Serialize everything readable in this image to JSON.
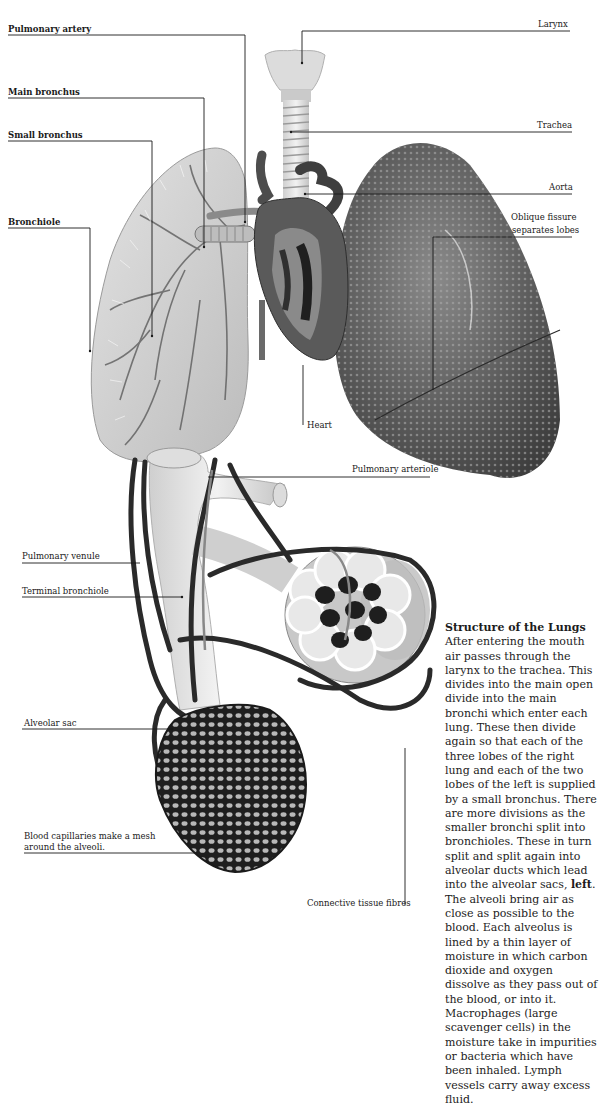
{
  "labels": {
    "pulmonary_artery": "Pulmonary artery",
    "main_bronchus": "Main bronchus",
    "small_bronchus": "Small bronchus",
    "bronchiole": "Bronchiole",
    "larynx": "Larynx",
    "trachea": "Trachea",
    "aorta": "Aorta",
    "oblique_fissure_1": "Oblique fissure",
    "oblique_fissure_2": "separates lobes",
    "heart": "Heart",
    "pulmonary_arteriole": "Pulmonary arteriole",
    "pulmonary_venule": "Pulmonary venule",
    "terminal_bronchiole": "Terminal bronchiole",
    "alveolar_sac": "Alveolar sac",
    "blood_capillaries_1": "Blood capillaries make a mesh",
    "blood_capillaries_2": "around the alveoli.",
    "connective_tissue": "Connective tissue fibres"
  },
  "article": {
    "title": "Structure of the Lungs",
    "body_before_bold": "After entering the mouth air passes through the larynx to the trachea. This divides into the main open divide into the main bronchi which enter each lung. These then divide again so that each of the three lobes of the right lung and each of the two lobes of the left is supplied by a small bronchus. There are more divisions as the smaller bronchi split into bronchioles. These in turn split and split again into alveolar ducts which lead into the alveolar sacs, ",
    "bold_word": "left",
    "body_after_bold": ". The alveoli bring air as close as possible to the blood. Each alveolus is lined by a thin layer of moisture in which carbon dioxide and oxygen dissolve as they pass out of the blood, or into it. Macrophages (large scavenger cells) in the moisture take in impurities or bacteria which have been inhaled. Lymph vessels carry away excess fluid."
  },
  "colors": {
    "line": "#1a1a1a",
    "lung_right_dark": "#5a5a5a",
    "lung_left_light": "#d0d0d0",
    "vessel_dark": "#2a2a2a"
  }
}
